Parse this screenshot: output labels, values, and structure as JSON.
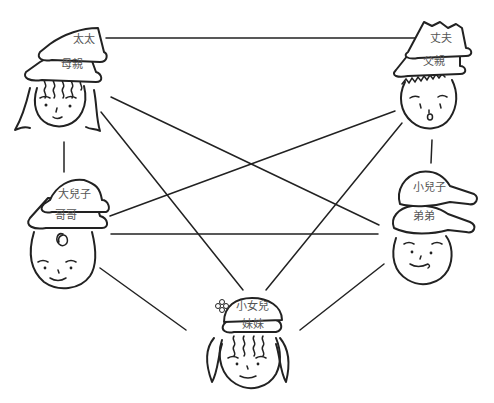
{
  "diagram": {
    "type": "family-relationship-network",
    "nodes": [
      {
        "id": "mother",
        "roles": [
          "太太",
          "母親"
        ]
      },
      {
        "id": "father",
        "roles": [
          "丈夫",
          "父親"
        ]
      },
      {
        "id": "elder-son",
        "roles": [
          "大兒子",
          "哥哥"
        ]
      },
      {
        "id": "younger-son",
        "roles": [
          "小兒子",
          "弟弟"
        ]
      },
      {
        "id": "daughter",
        "roles": [
          "小女兒",
          "妹妹"
        ]
      }
    ],
    "edges": [
      [
        "mother",
        "father"
      ],
      [
        "mother",
        "elder-son"
      ],
      [
        "mother",
        "younger-son"
      ],
      [
        "mother",
        "daughter"
      ],
      [
        "father",
        "younger-son"
      ],
      [
        "father",
        "elder-son"
      ],
      [
        "father",
        "daughter"
      ],
      [
        "elder-son",
        "younger-son"
      ],
      [
        "elder-son",
        "daughter"
      ],
      [
        "younger-son",
        "daughter"
      ]
    ]
  },
  "labels": {
    "mother_top": "太太",
    "mother_bottom": "母親",
    "father_top": "丈夫",
    "father_bottom": "父親",
    "elder_son_top": "大兒子",
    "elder_son_bottom": "哥哥",
    "younger_son_top": "小兒子",
    "younger_son_bottom": "弟弟",
    "daughter_top": "小女兒",
    "daughter_bottom": "妹妹"
  }
}
